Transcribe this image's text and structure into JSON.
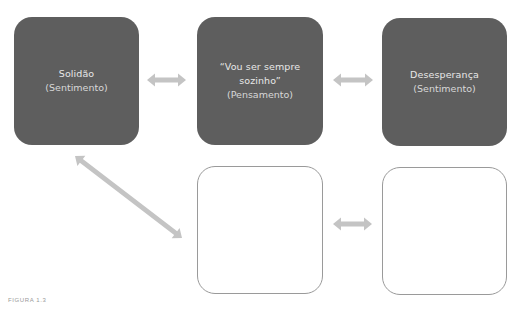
{
  "diagram": {
    "nodes": [
      {
        "id": "b1",
        "title": "Solidão",
        "subtitle": "(Sentimento)",
        "style": "filled"
      },
      {
        "id": "b2",
        "title": "“Vou ser sempre sozinho”",
        "subtitle": "(Pensamento)",
        "style": "filled"
      },
      {
        "id": "b3",
        "title": "Desesperança",
        "subtitle": "(Sentimento)",
        "style": "filled"
      },
      {
        "id": "b4",
        "title": "",
        "subtitle": "",
        "style": "empty"
      },
      {
        "id": "b5",
        "title": "",
        "subtitle": "",
        "style": "empty"
      }
    ],
    "edges": [
      {
        "from": "b1",
        "to": "b2",
        "type": "bidirectional"
      },
      {
        "from": "b2",
        "to": "b3",
        "type": "bidirectional"
      },
      {
        "from": "b1",
        "to": "b4",
        "type": "bidirectional"
      },
      {
        "from": "b4",
        "to": "b5",
        "type": "bidirectional"
      }
    ],
    "colors": {
      "filled_box": "#5e5e5e",
      "filled_text": "#e8e8e8",
      "empty_border": "#9a9a9a",
      "arrow": "#c4c4c4"
    }
  },
  "caption": "FIGURA 1.3"
}
